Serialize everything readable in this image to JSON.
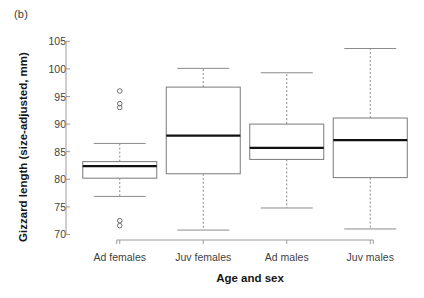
{
  "panel": {
    "label": "(b)"
  },
  "chart_data": {
    "type": "box",
    "title": "",
    "panel_label": "(b)",
    "xlabel": "Age and sex",
    "ylabel": "Gizzard length (size-adjusted, mm)",
    "categories": [
      "Ad females",
      "Juv females",
      "Ad males",
      "Juv males"
    ],
    "ylim": [
      69.0,
      105.6
    ],
    "yticks": [
      70,
      75,
      80,
      85,
      90,
      95,
      100,
      105
    ],
    "ytick_labels": [
      "70",
      "75",
      "80",
      "85",
      "90",
      "95",
      "100",
      "105"
    ],
    "grid": false,
    "legend": null,
    "boxes": [
      {
        "category": "Ad females",
        "whisker_low": 76.9,
        "q1": 80.2,
        "median": 82.4,
        "q3": 83.2,
        "whisker_high": 86.5,
        "outliers": [
          96.0,
          93.7,
          93.0,
          72.5,
          71.6
        ]
      },
      {
        "category": "Juv females",
        "whisker_low": 70.8,
        "q1": 81.0,
        "median": 87.9,
        "q3": 96.7,
        "whisker_high": 100.1,
        "outliers": []
      },
      {
        "category": "Ad males",
        "whisker_low": 74.8,
        "q1": 83.6,
        "median": 85.7,
        "q3": 90.0,
        "whisker_high": 99.3,
        "outliers": []
      },
      {
        "category": "Juv males",
        "whisker_low": 71.0,
        "q1": 80.3,
        "median": 87.1,
        "q3": 91.1,
        "whisker_high": 103.7,
        "outliers": []
      }
    ],
    "colors": {
      "box_stroke": "#7a7a7a",
      "median_stroke": "#111111",
      "whisker_stroke": "#8a8a8a",
      "axis_stroke": "#9a9a9a",
      "outlier_stroke": "#6f6f6f",
      "text": "#3f3f3f",
      "background": "#ffffff"
    }
  }
}
